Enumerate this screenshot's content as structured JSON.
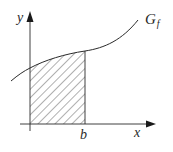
{
  "diagram": {
    "labels": {
      "y_axis": "y",
      "x_axis": "x",
      "graph": "G",
      "graph_subscript": "f",
      "bound": "b"
    },
    "colors": {
      "line": "#2a2a2a",
      "hatch": "#3a3a3a",
      "background": "#ffffff"
    }
  }
}
